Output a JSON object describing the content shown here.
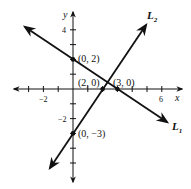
{
  "diagram": {
    "type": "coordinate-plane-two-lines",
    "axes": {
      "x_label": "x",
      "y_label": "y",
      "x_ticks": [
        -3,
        -2,
        -1,
        1,
        2,
        3,
        4,
        5,
        6
      ],
      "y_ticks": [
        -4,
        -3,
        -2,
        -1,
        1,
        2,
        3,
        4
      ],
      "x_tick_labels": [
        {
          "value": -2,
          "text": "−2"
        },
        {
          "value": 6,
          "text": "6"
        }
      ],
      "y_tick_labels": [
        {
          "value": 4,
          "text": "4"
        },
        {
          "value": -2,
          "text": "−2"
        }
      ],
      "color": "#111111"
    },
    "lines": [
      {
        "name": "L1",
        "label_main": "L",
        "label_sub": "1",
        "points": [
          [
            0,
            2
          ],
          [
            3,
            0
          ]
        ],
        "color": "#111111"
      },
      {
        "name": "L2",
        "label_main": "L",
        "label_sub": "2",
        "points": [
          [
            0,
            -3
          ],
          [
            2,
            0
          ]
        ],
        "color": "#111111"
      }
    ],
    "points": [
      {
        "x": 0,
        "y": 2,
        "label": "(0, 2)"
      },
      {
        "x": 2,
        "y": 0,
        "label": "(2, 0)"
      },
      {
        "x": 3,
        "y": 0,
        "label": "(3, 0)"
      },
      {
        "x": 0,
        "y": -3,
        "label": "(0, −3)"
      }
    ]
  }
}
